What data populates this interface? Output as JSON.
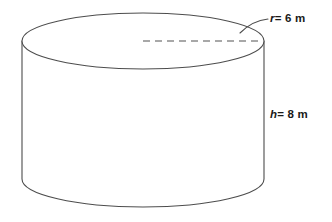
{
  "figure": {
    "kind": "solid-geometry-diagram",
    "shape": "cylinder",
    "background_color": "#ffffff",
    "stroke_color": "#4d4d4d",
    "dashed_color": "#8c8c8c",
    "text_color": "#1a1a1a",
    "geometry": {
      "top_ellipse_center_x": 143,
      "top_ellipse_center_y": 41,
      "radius_x": 121,
      "radius_y": 28,
      "bottom_ellipse_center_y": 179,
      "wall_height": 138
    }
  },
  "labels": {
    "radius": {
      "variable": "r",
      "relation": "= 6 m",
      "full_text": "r = 6 m",
      "value": 6,
      "unit": "m"
    },
    "height": {
      "variable": "h",
      "relation": "= 8 m",
      "full_text": "h = 8 m",
      "value": 8,
      "unit": "m"
    }
  },
  "annotations": {
    "radius_dashed_segment": "dashed radius line on top face",
    "radius_leader": "curved leader line from r label to top rim"
  }
}
